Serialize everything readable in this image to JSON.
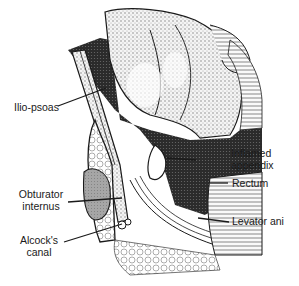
{
  "diagram": {
    "type": "anatomical-cross-section",
    "colors": {
      "ink": "#1a1a1a",
      "dark_stipple": "#2b2b2b",
      "gray_fill": "#9a9a9a",
      "bone_light": "#e8e8e8",
      "background": "#ffffff"
    },
    "labels": {
      "ilio_psoas": "Ilio-psoas",
      "inflamed_appendix_line1": "Inflamed",
      "inflamed_appendix_line2": "appendix",
      "obturator_internus_line1": "Obturator",
      "obturator_internus_line2": "internus",
      "rectum": "Rectum",
      "alcocks_canal_line1": "Alcock's",
      "alcocks_canal_line2": "canal",
      "levator_ani": "Levator ani"
    }
  }
}
